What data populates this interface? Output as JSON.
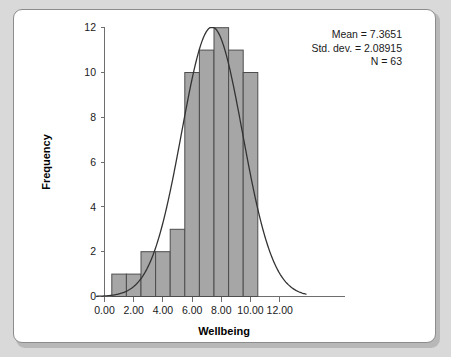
{
  "chart_data": {
    "type": "bar",
    "title": "",
    "subtitle": "",
    "xlabel": "Wellbeing",
    "ylabel": "Frequency",
    "xlim": [
      -0.55,
      13.8
    ],
    "ylim": [
      0,
      12
    ],
    "grid": false,
    "legend_position": "none",
    "bin_width": 1,
    "bin_centers": [
      1,
      2,
      3,
      4,
      5,
      6,
      7,
      8,
      9,
      10
    ],
    "bin_edges": [
      0.5,
      1.5,
      2.5,
      3.5,
      4.5,
      5.5,
      6.5,
      7.5,
      8.5,
      9.5,
      10.5
    ],
    "categories": [
      "0.5-1.5",
      "1.5-2.5",
      "2.5-3.5",
      "3.5-4.5",
      "4.5-5.5",
      "5.5-6.5",
      "6.5-7.5",
      "7.5-8.5",
      "8.5-9.5",
      "9.5-10.5"
    ],
    "values": [
      1,
      1,
      2,
      2,
      3,
      10,
      11,
      12,
      11,
      10
    ],
    "xticks": [
      "0.00",
      "2.00",
      "4.00",
      "6.00",
      "8.00",
      "10.00",
      "12.00"
    ],
    "xtick_values": [
      0,
      2,
      4,
      6,
      8,
      10,
      12
    ],
    "yticks": [
      "0",
      "2",
      "4",
      "6",
      "8",
      "10",
      "12"
    ],
    "ytick_values": [
      0,
      2,
      4,
      6,
      8,
      10,
      12
    ],
    "overlay": {
      "type": "line",
      "name": "normal-curve",
      "mean": 7.3651,
      "std_dev": 2.08915,
      "n": 63,
      "peak_value": 12.03
    },
    "annotations": [
      "Mean = 7.3651",
      "Std. dev. = 2.08915",
      "N = 63"
    ],
    "colors": {
      "bar_fill": "#a6a6a6",
      "bar_edge": "#4d4d4d",
      "curve": "#333333",
      "axis": "#6e6e6e",
      "panel_background": "#ffffff",
      "page_background": "#d9d9d9"
    }
  },
  "stats_box": {
    "mean_label": "Mean = 7.3651",
    "stddev_label": "Std. dev. = 2.08915",
    "n_label": "N = 63"
  },
  "axes": {
    "x_title": "Wellbeing",
    "y_title": "Frequency",
    "x_tick_labels": [
      "0.00",
      "2.00",
      "4.00",
      "6.00",
      "8.00",
      "10.00",
      "12.00"
    ],
    "y_tick_labels": [
      "0",
      "2",
      "4",
      "6",
      "8",
      "10",
      "12"
    ]
  }
}
